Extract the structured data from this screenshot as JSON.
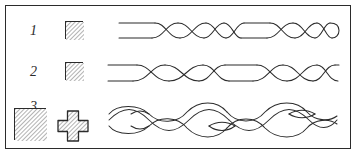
{
  "figure": {
    "type": "line-drawing-diagram",
    "background_color": "#ffffff",
    "ink_color": "#2b2b2b",
    "frame": {
      "visible": true,
      "border_color": "#2b2b2b",
      "border_width_px": 1.4,
      "x": 5,
      "y": 5,
      "width": 346,
      "height": 144
    }
  },
  "rows": [
    {
      "id": "row-1",
      "label": "1",
      "label_style": "italic-serif",
      "label_x": 30,
      "label_y": 24,
      "swatch": {
        "name": "hatched-square-small",
        "shape": "square",
        "x": 65,
        "y": 21,
        "size": 18,
        "fill_pattern": "diagonal-hatch",
        "fill_color": "#b9b9b9",
        "stroke_color": "#2b2b2b"
      },
      "braid": {
        "name": "tight-twisted-cord",
        "x": 118,
        "y": 18,
        "width": 222,
        "height": 26,
        "band_height": 16,
        "description": "flat band with two short tight-twist segments separated by straight runs",
        "twist_segments": [
          {
            "start_frac": 0.17,
            "end_frac": 0.45,
            "turns": 4
          },
          {
            "start_frac": 0.62,
            "end_frac": 0.9,
            "turns": 4
          }
        ],
        "strand_count": 2
      }
    },
    {
      "id": "row-2",
      "label": "2",
      "label_style": "italic-serif",
      "label_x": 30,
      "label_y": 65,
      "swatch": {
        "name": "hatched-square-small",
        "shape": "square",
        "x": 65,
        "y": 62,
        "size": 18,
        "fill_pattern": "diagonal-hatch",
        "fill_color": "#b9b9b9",
        "stroke_color": "#2b2b2b"
      },
      "braid": {
        "name": "medium-twisted-cord",
        "x": 107,
        "y": 60,
        "width": 233,
        "height": 28,
        "band_height": 18,
        "description": "flat band with two medium-pitch twist segments separated by a straight run",
        "twist_segments": [
          {
            "start_frac": 0.12,
            "end_frac": 0.46,
            "turns": 3
          },
          {
            "start_frac": 0.62,
            "end_frac": 0.96,
            "turns": 3
          }
        ],
        "strand_count": 2
      }
    },
    {
      "id": "row-3",
      "label": "3",
      "label_style": "italic-serif",
      "label_x": 30,
      "label_y": 103,
      "swatch": {
        "name": "hatched-square-large",
        "shape": "square",
        "x": 14,
        "y": 108,
        "size": 32,
        "fill_pattern": "diagonal-hatch",
        "fill_color": "#b9b9b9",
        "stroke_color": "#2b2b2b"
      },
      "swatch_secondary": {
        "name": "hatched-cross",
        "shape": "plus-cross",
        "x": 58,
        "y": 110,
        "width": 30,
        "height": 30,
        "arm_thickness_frac": 0.38,
        "fill_pattern": "diagonal-hatch",
        "fill_color": "#b9b9b9",
        "stroke_color": "#2b2b2b"
      },
      "braid": {
        "name": "open-plait-braid",
        "x": 105,
        "y": 98,
        "width": 235,
        "height": 46,
        "band_height": 38,
        "description": "wide open plait with large crossing loops and lens-shaped eyes",
        "loop_count": 4,
        "strand_count": 3
      }
    }
  ],
  "legend_note": {
    "visible": false,
    "text": ""
  }
}
